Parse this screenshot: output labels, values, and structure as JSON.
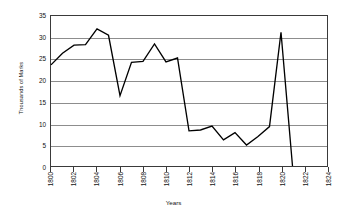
{
  "chart_data": {
    "type": "line",
    "title": "",
    "xlabel": "Years",
    "ylabel": "Thousands of Marks",
    "xlim": [
      1800,
      1824
    ],
    "ylim": [
      0,
      35
    ],
    "grid": true,
    "legend": "none",
    "xticks": [
      1800,
      1802,
      1804,
      1806,
      1808,
      1810,
      1812,
      1814,
      1816,
      1818,
      1820,
      1822,
      1824
    ],
    "xtick_labels": [
      "1800",
      "1802",
      "1804",
      "1806",
      "1808",
      "1810",
      "1812",
      "1814",
      "1816",
      "1818",
      "1820",
      "1822",
      "1824"
    ],
    "yticks": [
      0,
      5,
      10,
      15,
      20,
      25,
      30,
      35
    ],
    "ytick_labels": [
      "0",
      "5",
      "10",
      "15",
      "20",
      "25",
      "30",
      "35"
    ],
    "line_color": "#000000",
    "grid_color": "#8d8d8d",
    "series": [
      {
        "name": "Marks",
        "x": [
          1800,
          1801,
          1802,
          1803,
          1804,
          1805,
          1806,
          1807,
          1808,
          1809,
          1810,
          1811,
          1812,
          1813,
          1814,
          1815,
          1816,
          1817,
          1818,
          1819,
          1820,
          1821
        ],
        "values": [
          23.6,
          26.3,
          28.2,
          28.3,
          32.0,
          30.5,
          16.4,
          24.2,
          24.4,
          28.5,
          24.3,
          25.2,
          8.2,
          8.4,
          9.3,
          6.1,
          7.8,
          4.9,
          6.9,
          9.2,
          31.2,
          0.0
        ]
      }
    ]
  }
}
